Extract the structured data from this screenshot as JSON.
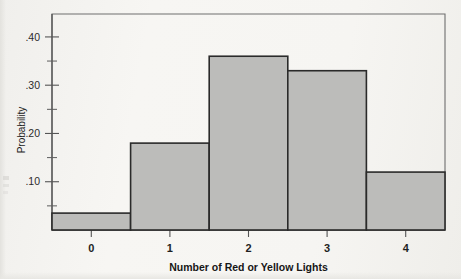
{
  "chart_data": {
    "type": "bar",
    "title": "",
    "subtitle": "",
    "xlabel": "Number of Red or Yellow Lights",
    "ylabel": "Probability",
    "categories": [
      "0",
      "1",
      "2",
      "3",
      "4"
    ],
    "values": [
      0.035,
      0.18,
      0.36,
      0.33,
      0.12
    ],
    "series": [
      {
        "name": "Probability",
        "values": [
          0.035,
          0.18,
          0.36,
          0.33,
          0.12
        ]
      }
    ],
    "xlim": [
      -0.5,
      4.5
    ],
    "ylim": [
      0.0,
      0.4475
    ],
    "ytick_labels": [
      ".10",
      ".20",
      ".30",
      ".40"
    ],
    "ytick_values": [
      0.1,
      0.2,
      0.3,
      0.4
    ],
    "yminor_tick_values": [
      0.05,
      0.15,
      0.25,
      0.35
    ],
    "xtick_labels": [
      "0",
      "1",
      "2",
      "3",
      "4"
    ],
    "xtick_values": [
      0,
      1,
      2,
      3,
      4
    ],
    "grid": false,
    "legend": false,
    "legend_position": "none",
    "bar_width": 1.0,
    "annotations": [],
    "colors": {
      "bar_fill": "#bcbcba",
      "bar_outline": "#2a2a2a",
      "axis": "#555555",
      "frame": "#6e6e6e",
      "text": "#1f1f1f",
      "background": "#f5f4f1"
    }
  },
  "figure": {
    "plot_frame": {
      "left": 52,
      "top": 14,
      "right": 445,
      "bottom": 230
    }
  }
}
